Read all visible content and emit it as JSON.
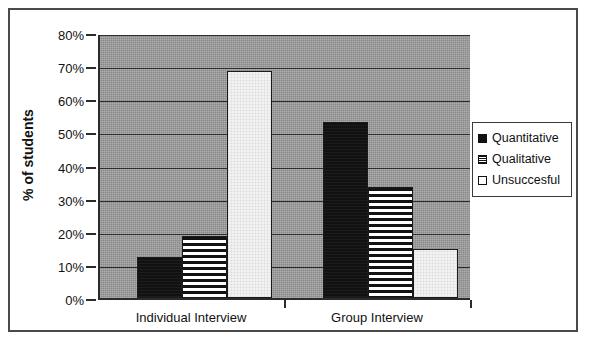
{
  "chart_data": {
    "type": "bar",
    "title": "",
    "xlabel": "",
    "ylabel": "% of students",
    "ylim": [
      0,
      80
    ],
    "ytick_step": 10,
    "grid": true,
    "legend_position": "right",
    "categories": [
      "Individual Interview",
      "Group Interview"
    ],
    "series": [
      {
        "name": "Quantitative",
        "values": [
          12.5,
          53.0
        ],
        "swatch": "solid-black"
      },
      {
        "name": "Qualitative",
        "values": [
          18.8,
          33.5
        ],
        "swatch": "horizontal-stripes"
      },
      {
        "name": "Unsuccesful",
        "values": [
          68.5,
          14.8
        ],
        "swatch": "white"
      }
    ],
    "ytick_labels": [
      "80%",
      "70%",
      "60%",
      "50%",
      "40%",
      "30%",
      "20%",
      "10%",
      "0%"
    ],
    "ytick_values": [
      80,
      70,
      60,
      50,
      40,
      30,
      20,
      10,
      0
    ]
  },
  "legend": {
    "items": [
      {
        "label": "Quantitative"
      },
      {
        "label": "Qualitative"
      },
      {
        "label": "Unsuccesful"
      }
    ]
  },
  "colors": {
    "plot_background": "#9a9a9a",
    "gridline": "#2e2e2e",
    "axis": "#2b2b2b",
    "frame": "#4a4a4a",
    "quantitative": "#111111",
    "qualitative": "#ffffff",
    "unsuccesful": "#f2f2f2",
    "page_background": "#ffffff"
  }
}
